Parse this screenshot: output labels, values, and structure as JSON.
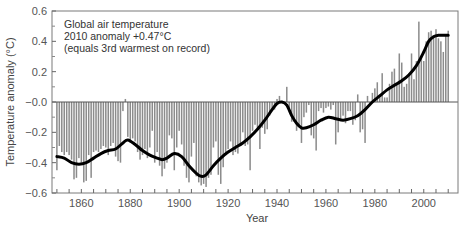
{
  "chart_data": {
    "type": "bar",
    "title": "",
    "xlabel": "Year",
    "ylabel": "Temperature anomaly (°C)",
    "xlim": [
      1848,
      2014
    ],
    "ylim": [
      -0.6,
      0.6
    ],
    "grid": false,
    "legend": "none",
    "annotation": [
      "Global air temperature",
      "2010 anomaly +0.47°C",
      "(equals 3rd warmest on record)"
    ],
    "yticks": [
      {
        "value": 0.6,
        "label": "0.6"
      },
      {
        "value": 0.4,
        "label": "0.4"
      },
      {
        "value": 0.2,
        "label": "0.2"
      },
      {
        "value": 0.0,
        "label": "−0.0"
      },
      {
        "value": -0.2,
        "label": "−0.2"
      },
      {
        "value": -0.4,
        "label": "−0.4"
      },
      {
        "value": -0.6,
        "label": "−0.6"
      }
    ],
    "xticks": [
      {
        "value": 1860,
        "label": "1860"
      },
      {
        "value": 1880,
        "label": "1880"
      },
      {
        "value": 1900,
        "label": "1900"
      },
      {
        "value": 1920,
        "label": "1920"
      },
      {
        "value": 1940,
        "label": "1940"
      },
      {
        "value": 1960,
        "label": "1960"
      },
      {
        "value": 1980,
        "label": "1980"
      },
      {
        "value": 2000,
        "label": "2000"
      }
    ],
    "series": [
      {
        "name": "Annual anomaly",
        "kind": "bar",
        "color": "#8c8c8c",
        "x": [
          1850,
          1851,
          1852,
          1853,
          1854,
          1855,
          1856,
          1857,
          1858,
          1859,
          1860,
          1861,
          1862,
          1863,
          1864,
          1865,
          1866,
          1867,
          1868,
          1869,
          1870,
          1871,
          1872,
          1873,
          1874,
          1875,
          1876,
          1877,
          1878,
          1879,
          1880,
          1881,
          1882,
          1883,
          1884,
          1885,
          1886,
          1887,
          1888,
          1889,
          1890,
          1891,
          1892,
          1893,
          1894,
          1895,
          1896,
          1897,
          1898,
          1899,
          1900,
          1901,
          1902,
          1903,
          1904,
          1905,
          1906,
          1907,
          1908,
          1909,
          1910,
          1911,
          1912,
          1913,
          1914,
          1915,
          1916,
          1917,
          1918,
          1919,
          1920,
          1921,
          1922,
          1923,
          1924,
          1925,
          1926,
          1927,
          1928,
          1929,
          1930,
          1931,
          1932,
          1933,
          1934,
          1935,
          1936,
          1937,
          1938,
          1939,
          1940,
          1941,
          1942,
          1943,
          1944,
          1945,
          1946,
          1947,
          1948,
          1949,
          1950,
          1951,
          1952,
          1953,
          1954,
          1955,
          1956,
          1957,
          1958,
          1959,
          1960,
          1961,
          1962,
          1963,
          1964,
          1965,
          1966,
          1967,
          1968,
          1969,
          1970,
          1971,
          1972,
          1973,
          1974,
          1975,
          1976,
          1977,
          1978,
          1979,
          1980,
          1981,
          1982,
          1983,
          1984,
          1985,
          1986,
          1987,
          1988,
          1989,
          1990,
          1991,
          1992,
          1993,
          1994,
          1995,
          1996,
          1997,
          1998,
          1999,
          2000,
          2001,
          2002,
          2003,
          2004,
          2005,
          2006,
          2007,
          2008,
          2009,
          2010
        ],
        "values": [
          -0.45,
          -0.29,
          -0.33,
          -0.35,
          -0.33,
          -0.35,
          -0.38,
          -0.51,
          -0.5,
          -0.37,
          -0.4,
          -0.53,
          -0.52,
          -0.35,
          -0.5,
          -0.33,
          -0.32,
          -0.33,
          -0.31,
          -0.29,
          -0.3,
          -0.35,
          -0.29,
          -0.27,
          -0.36,
          -0.39,
          -0.4,
          -0.06,
          0.02,
          -0.23,
          -0.27,
          -0.24,
          -0.26,
          -0.33,
          -0.38,
          -0.35,
          -0.31,
          -0.37,
          -0.3,
          -0.19,
          -0.4,
          -0.33,
          -0.42,
          -0.49,
          -0.44,
          -0.4,
          -0.22,
          -0.24,
          -0.45,
          -0.3,
          -0.19,
          -0.28,
          -0.42,
          -0.5,
          -0.53,
          -0.36,
          -0.27,
          -0.49,
          -0.53,
          -0.55,
          -0.54,
          -0.56,
          -0.5,
          -0.48,
          -0.3,
          -0.26,
          -0.48,
          -0.54,
          -0.43,
          -0.35,
          -0.31,
          -0.26,
          -0.35,
          -0.33,
          -0.34,
          -0.28,
          -0.2,
          -0.29,
          -0.28,
          -0.45,
          -0.19,
          -0.15,
          -0.17,
          -0.31,
          -0.17,
          -0.21,
          -0.18,
          -0.09,
          -0.05,
          -0.05,
          0.02,
          0.04,
          0.0,
          -0.01,
          0.1,
          -0.06,
          -0.13,
          -0.13,
          -0.19,
          -0.16,
          -0.27,
          -0.1,
          -0.07,
          -0.02,
          -0.22,
          -0.24,
          -0.32,
          -0.06,
          -0.04,
          -0.07,
          -0.04,
          -0.03,
          -0.05,
          -0.02,
          -0.28,
          -0.2,
          -0.12,
          -0.09,
          -0.14,
          -0.06,
          -0.06,
          -0.15,
          -0.12,
          0.05,
          -0.2,
          -0.18,
          -0.27,
          0.04,
          -0.01,
          0.06,
          0.09,
          0.13,
          0.05,
          0.19,
          0.03,
          0.03,
          0.12,
          0.2,
          0.22,
          0.11,
          0.32,
          0.26,
          0.1,
          0.12,
          0.19,
          0.32,
          0.15,
          0.27,
          0.53,
          0.3,
          0.27,
          0.4,
          0.46,
          0.47,
          0.44,
          0.48,
          0.42,
          0.4,
          0.33,
          0.44,
          0.47
        ],
        "y_display_range": [
          -0.6,
          0.6
        ]
      },
      {
        "name": "Smoothed trend",
        "kind": "line",
        "color": "#000000",
        "x": [
          1850,
          1853,
          1856,
          1859,
          1862,
          1865,
          1868,
          1871,
          1874,
          1877,
          1879,
          1882,
          1885,
          1888,
          1891,
          1893,
          1895,
          1898,
          1901,
          1904,
          1907,
          1909,
          1911,
          1914,
          1917,
          1920,
          1923,
          1926,
          1929,
          1932,
          1935,
          1938,
          1940,
          1942,
          1944,
          1946,
          1948,
          1950,
          1952,
          1955,
          1958,
          1961,
          1964,
          1967,
          1970,
          1973,
          1976,
          1979,
          1982,
          1985,
          1988,
          1991,
          1994,
          1997,
          2000,
          2002,
          2004,
          2006,
          2008,
          2010
        ],
        "values": [
          -0.36,
          -0.37,
          -0.4,
          -0.41,
          -0.4,
          -0.37,
          -0.34,
          -0.32,
          -0.31,
          -0.27,
          -0.25,
          -0.28,
          -0.32,
          -0.35,
          -0.37,
          -0.38,
          -0.37,
          -0.34,
          -0.36,
          -0.42,
          -0.47,
          -0.49,
          -0.48,
          -0.42,
          -0.37,
          -0.33,
          -0.3,
          -0.27,
          -0.23,
          -0.18,
          -0.12,
          -0.05,
          -0.01,
          0.0,
          -0.02,
          -0.09,
          -0.14,
          -0.17,
          -0.17,
          -0.15,
          -0.12,
          -0.1,
          -0.11,
          -0.12,
          -0.11,
          -0.09,
          -0.05,
          0.0,
          0.04,
          0.08,
          0.11,
          0.14,
          0.18,
          0.24,
          0.33,
          0.4,
          0.43,
          0.44,
          0.44,
          0.44
        ]
      }
    ]
  }
}
